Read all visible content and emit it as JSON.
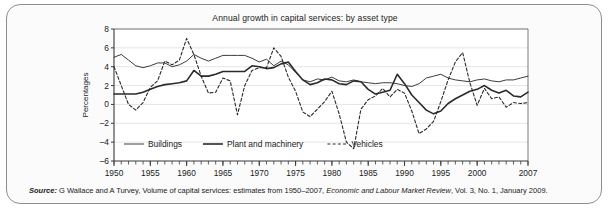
{
  "figure": {
    "title": "Annual growth in capital services: by asset type",
    "source_lead": "Source:",
    "source_body_1": " G Wallace and A Turvey, Volume of capital services: estimates from 1950–2007, ",
    "source_journal": "Economic and Labour Market Review",
    "source_body_2": ", Vol. 3, No. 1, January 2009."
  },
  "chart_data": {
    "type": "line",
    "title": "Annual growth in capital services: by asset type",
    "xlabel": "",
    "ylabel": "Percentages",
    "xlim": [
      1950,
      2007
    ],
    "ylim": [
      -6,
      8
    ],
    "ytick_values": [
      8,
      6,
      4,
      2,
      0,
      -2,
      -4,
      -6
    ],
    "ytick_labels": [
      "8",
      "6",
      "4",
      "2",
      "0",
      "–2",
      "–4",
      "–6"
    ],
    "xtick_values": [
      1950,
      1955,
      1960,
      1965,
      1970,
      1975,
      1980,
      1985,
      1990,
      1995,
      2000,
      2007
    ],
    "xtick_labels": [
      "1950",
      "1955",
      "1960",
      "1965",
      "1970",
      "1975",
      "1980",
      "1985",
      "1990",
      "1995",
      "2000",
      "2007"
    ],
    "x_minor_step": 1,
    "grid": "horizontal",
    "legend_position": "inside-bottom-left",
    "x": [
      1950,
      1951,
      1952,
      1953,
      1954,
      1955,
      1956,
      1957,
      1958,
      1959,
      1960,
      1961,
      1962,
      1963,
      1964,
      1965,
      1966,
      1967,
      1968,
      1969,
      1970,
      1971,
      1972,
      1973,
      1974,
      1975,
      1976,
      1977,
      1978,
      1979,
      1980,
      1981,
      1982,
      1983,
      1984,
      1985,
      1986,
      1987,
      1988,
      1989,
      1990,
      1991,
      1992,
      1993,
      1994,
      1995,
      1996,
      1997,
      1998,
      1999,
      2000,
      2001,
      2002,
      2003,
      2004,
      2005,
      2006,
      2007
    ],
    "series": [
      {
        "name": "Buildings",
        "style": "solid-thin",
        "color": "#3c3c3c",
        "values": [
          5.0,
          5.3,
          4.7,
          4.1,
          3.9,
          4.1,
          4.4,
          4.4,
          4.0,
          4.2,
          4.6,
          5.3,
          4.9,
          4.6,
          4.9,
          5.2,
          5.2,
          5.2,
          5.2,
          4.9,
          4.5,
          4.8,
          4.1,
          4.6,
          4.2,
          3.4,
          2.6,
          2.4,
          2.7,
          2.6,
          2.9,
          2.5,
          2.4,
          2.6,
          2.4,
          2.3,
          2.2,
          2.3,
          2.3,
          2.2,
          2.0,
          1.9,
          2.2,
          2.8,
          3.0,
          3.2,
          2.8,
          2.6,
          2.5,
          2.4,
          2.6,
          2.7,
          2.5,
          2.4,
          2.6,
          2.6,
          2.8,
          3.0
        ],
        "linewidth": 1.0
      },
      {
        "name": "Plant and machinery",
        "style": "solid-thick",
        "color": "#2a2a2a",
        "values": [
          1.1,
          1.1,
          1.1,
          1.1,
          1.3,
          1.6,
          1.9,
          2.1,
          2.2,
          2.3,
          2.5,
          3.6,
          3.0,
          3.0,
          3.2,
          3.5,
          3.5,
          3.5,
          3.5,
          4.1,
          4.0,
          3.8,
          3.9,
          4.3,
          4.5,
          3.5,
          2.6,
          2.1,
          2.3,
          2.7,
          2.6,
          2.2,
          2.1,
          2.5,
          2.4,
          1.6,
          1.1,
          1.3,
          1.5,
          3.2,
          2.2,
          1.0,
          0.2,
          -0.6,
          -1.0,
          -0.7,
          0.1,
          0.6,
          1.0,
          1.4,
          1.6,
          2.0,
          1.5,
          1.2,
          1.5,
          0.9,
          0.8,
          1.3
        ],
        "linewidth": 1.6
      },
      {
        "name": "Vehicles",
        "style": "dashed",
        "color": "#2a2a2a",
        "values": [
          4.0,
          2.0,
          0.0,
          -0.6,
          0.2,
          1.8,
          2.5,
          4.6,
          4.2,
          4.7,
          7.0,
          5.3,
          3.0,
          1.2,
          1.3,
          2.8,
          2.5,
          -1.1,
          2.0,
          3.6,
          3.9,
          3.9,
          6.0,
          5.1,
          2.9,
          1.4,
          -0.8,
          -1.3,
          -0.5,
          0.3,
          1.4,
          -1.0,
          -4.0,
          -4.7,
          -0.5,
          0.5,
          0.9,
          1.7,
          0.8,
          1.6,
          1.2,
          -0.7,
          -3.1,
          -2.6,
          -1.8,
          0.3,
          2.6,
          4.5,
          5.5,
          2.3,
          -0.1,
          1.7,
          0.6,
          0.8,
          -0.3,
          0.2,
          0.1,
          0.2
        ],
        "linewidth": 1.1
      }
    ],
    "legend": [
      {
        "label": "Buildings",
        "style": "solid-thin"
      },
      {
        "label": "Plant and machinery",
        "style": "solid-thick"
      },
      {
        "label": "Vehicles",
        "style": "dashed"
      }
    ]
  }
}
